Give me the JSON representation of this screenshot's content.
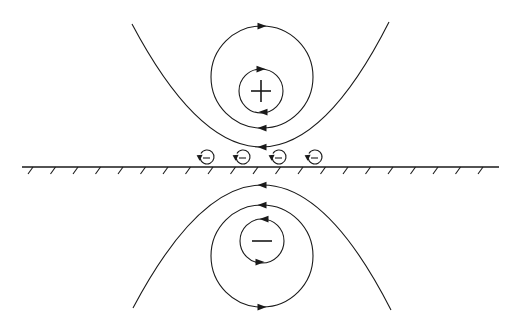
{
  "diagram": {
    "stroke_color": "#1a1a1a",
    "background": "#ffffff",
    "wall": {
      "x1": 22,
      "x2": 499,
      "y": 167,
      "hatch_spacing": 22.5,
      "hatch_start": 30
    },
    "upper_vortex": {
      "sign": "+",
      "center": [
        262,
        90
      ],
      "inner_circle": {
        "cx": 261,
        "cy": 91,
        "r": 22,
        "direction": "clockwise"
      },
      "middle_circle": {
        "cx": 262,
        "cy": 77,
        "r": 51,
        "direction": "clockwise"
      },
      "outer_arc": {
        "left": [
          132,
          24
        ],
        "bottom": [
          263,
          147
        ],
        "right": [
          389,
          22
        ],
        "direction": "right-to-left at bottom"
      }
    },
    "lower_vortex": {
      "sign": "−",
      "center": [
        262,
        241
      ],
      "inner_circle": {
        "cx": 262,
        "cy": 241,
        "r": 22,
        "direction": "counter-clockwise"
      },
      "middle_circle": {
        "cx": 262,
        "cy": 256,
        "r": 51,
        "direction": "counter-clockwise"
      },
      "outer_arc": {
        "left": [
          133,
          308
        ],
        "top": [
          264,
          185
        ],
        "right": [
          391,
          310
        ],
        "direction": "right-to-left at top"
      }
    },
    "secondary_vortices": [
      {
        "sign": "−",
        "cx": 207,
        "cy": 157,
        "r": 7
      },
      {
        "sign": "−",
        "cx": 243,
        "cy": 157,
        "r": 7
      },
      {
        "sign": "−",
        "cx": 279,
        "cy": 157,
        "r": 7
      },
      {
        "sign": "−",
        "cx": 315,
        "cy": 157,
        "r": 7
      }
    ],
    "labels": {
      "upper_sign": "+",
      "lower_sign": "−"
    }
  }
}
